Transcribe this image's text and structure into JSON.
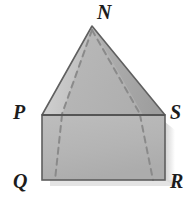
{
  "figure": {
    "kind": "geometry-solid-diagram",
    "background_color": "#ffffff",
    "vertices": [
      {
        "id": "N",
        "label": "N",
        "role": "pyramid-apex",
        "x": 92,
        "y": 26
      },
      {
        "id": "P",
        "label": "P",
        "role": "prism-top-front-left",
        "x": 42,
        "y": 115
      },
      {
        "id": "S",
        "label": "S",
        "role": "prism-top-front-right",
        "x": 165,
        "y": 115
      },
      {
        "id": "Q",
        "label": "Q",
        "role": "prism-bottom-front-left",
        "x": 42,
        "y": 180
      },
      {
        "id": "R",
        "label": "R",
        "role": "prism-bottom-front-right",
        "x": 165,
        "y": 180
      }
    ],
    "labels": {
      "N": "N",
      "P": "P",
      "S": "S",
      "Q": "Q",
      "R": "R"
    },
    "colors": {
      "pyramid_left_face": "#c6c6c6",
      "pyramid_front_face": "#b4b4b4",
      "pyramid_right_face": "#a8a8a8",
      "prism_front_face": "#b6b6b6",
      "prism_top_face": "#bfbfbf",
      "outline": "#5e5e5e",
      "hidden_edge": "#8a8a8a",
      "shadow": "#d8d8d8",
      "label_color": "#1c1c1c"
    },
    "edges": {
      "solid": [
        "N-P",
        "N-S",
        "P-S",
        "P-Q",
        "Q-R",
        "R-S"
      ],
      "hidden_dashed": [
        "N-backLeft",
        "N-backRight",
        "backLeft-down",
        "backRight-down"
      ]
    }
  }
}
